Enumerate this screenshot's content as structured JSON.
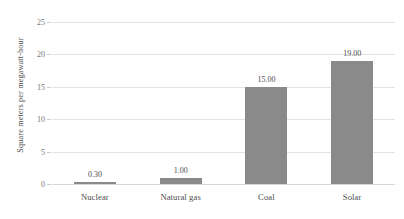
{
  "chart_data": {
    "type": "bar",
    "title": "",
    "xlabel": "",
    "ylabel": "Square meters per megawatt-hour",
    "categories": [
      "Nuclear",
      "Natural gas",
      "Coal",
      "Solar"
    ],
    "values": [
      0.3,
      1.0,
      15.0,
      19.0
    ],
    "value_labels": [
      "0.30",
      "1.00",
      "15.00",
      "19.00"
    ],
    "ylim": [
      0,
      25
    ],
    "yticks": [
      0,
      5,
      10,
      15,
      20,
      25
    ],
    "ytick_labels": [
      "0",
      "5",
      "10",
      "15",
      "20",
      "25"
    ],
    "grid": "horizontal",
    "legend": "none",
    "bar_color": "#8a8a8a",
    "gridline_color": "#e3e3e3",
    "text_color": "#4d4d4d"
  }
}
